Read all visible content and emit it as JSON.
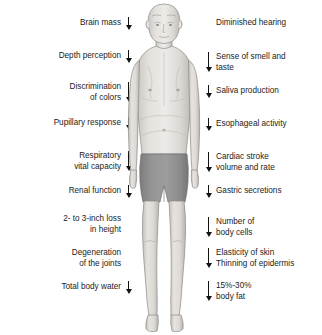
{
  "diagram": {
    "background_color": "#ffffff",
    "text_color": "#1b1b1b",
    "arrow_color": "#121212",
    "skin_color": "#d9d6d2",
    "shorts_color": "#8d8d8d"
  },
  "left_labels": [
    {
      "text": "Brain mass",
      "arrow": "down",
      "arrow_size": "short",
      "y": 28
    },
    {
      "text": "Depth perception",
      "arrow": "down",
      "arrow_size": "short",
      "y": 61
    },
    {
      "text": "Discrimination\nof colors",
      "arrow": "down",
      "arrow_size": "tall",
      "y": 93
    },
    {
      "text": "Pupillary response",
      "arrow": "down",
      "arrow_size": "short",
      "y": 128
    },
    {
      "text": "Respiratory\nvital capacity",
      "arrow": "down",
      "arrow_size": "tall",
      "y": 162
    },
    {
      "text": "Renal function",
      "arrow": "down",
      "arrow_size": "short",
      "y": 196
    },
    {
      "text": "2- to 3-inch loss\nin height",
      "arrow": "none",
      "arrow_size": "tall",
      "y": 225
    },
    {
      "text": "Degeneration\nof the joints",
      "arrow": "none",
      "arrow_size": "tall",
      "y": 259
    },
    {
      "text": "Total body water",
      "arrow": "down",
      "arrow_size": "short",
      "y": 292
    }
  ],
  "right_labels": [
    {
      "text": "Diminished hearing",
      "arrow": "none",
      "arrow_size": "short",
      "y": 28
    },
    {
      "text": "Sense of smell and\ntaste",
      "arrow": "down",
      "arrow_size": "tall",
      "y": 63
    },
    {
      "text": "Saliva production",
      "arrow": "down",
      "arrow_size": "short",
      "y": 96
    },
    {
      "text": "Esophageal activity",
      "arrow": "down",
      "arrow_size": "short",
      "y": 129
    },
    {
      "text": "Cardiac stroke\nvolume and rate",
      "arrow": "down",
      "arrow_size": "tall",
      "y": 163
    },
    {
      "text": "Gastric secretions",
      "arrow": "down",
      "arrow_size": "short",
      "y": 196
    },
    {
      "text": "Number of\nbody cells",
      "arrow": "down",
      "arrow_size": "tall",
      "y": 228
    },
    {
      "text": "Elasticity of skin\nThinning of epidermis",
      "arrow": "down",
      "arrow_size": "tall",
      "y": 259
    },
    {
      "text": "15%-30%\nbody fat",
      "arrow": "down",
      "arrow_size": "tall",
      "y": 292
    }
  ],
  "figure_illustration": {
    "subject": "elderly-man-standing-front-view",
    "clothing": "gray-shorts",
    "features": "bald-head-sagging-chest-protruding-abdomen-thin-limbs"
  }
}
